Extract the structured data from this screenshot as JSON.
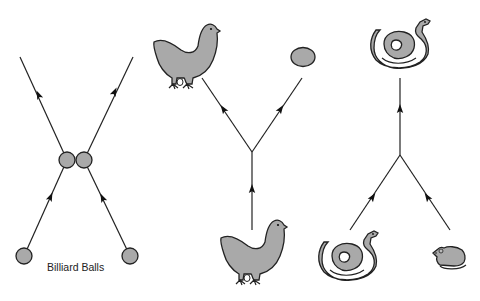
{
  "diagram": {
    "panels": [
      {
        "name": "billiard-balls",
        "label": "Billiard Balls",
        "inputs": [
          "ball",
          "ball"
        ],
        "outputs": [
          "ball",
          "ball"
        ],
        "type": "scattering (two in, two out)"
      },
      {
        "name": "chicken-lays-egg",
        "label": "",
        "inputs": [
          "chicken"
        ],
        "outputs": [
          "chicken",
          "egg"
        ],
        "type": "decay (one in, two out)"
      },
      {
        "name": "snake-eats-mouse",
        "label": "",
        "inputs": [
          "snake",
          "mouse"
        ],
        "outputs": [
          "snake"
        ],
        "type": "absorption (two in, one out)"
      }
    ],
    "colors": {
      "fill": "#a9a9a9",
      "stroke": "#222222",
      "background": "#ffffff"
    }
  }
}
